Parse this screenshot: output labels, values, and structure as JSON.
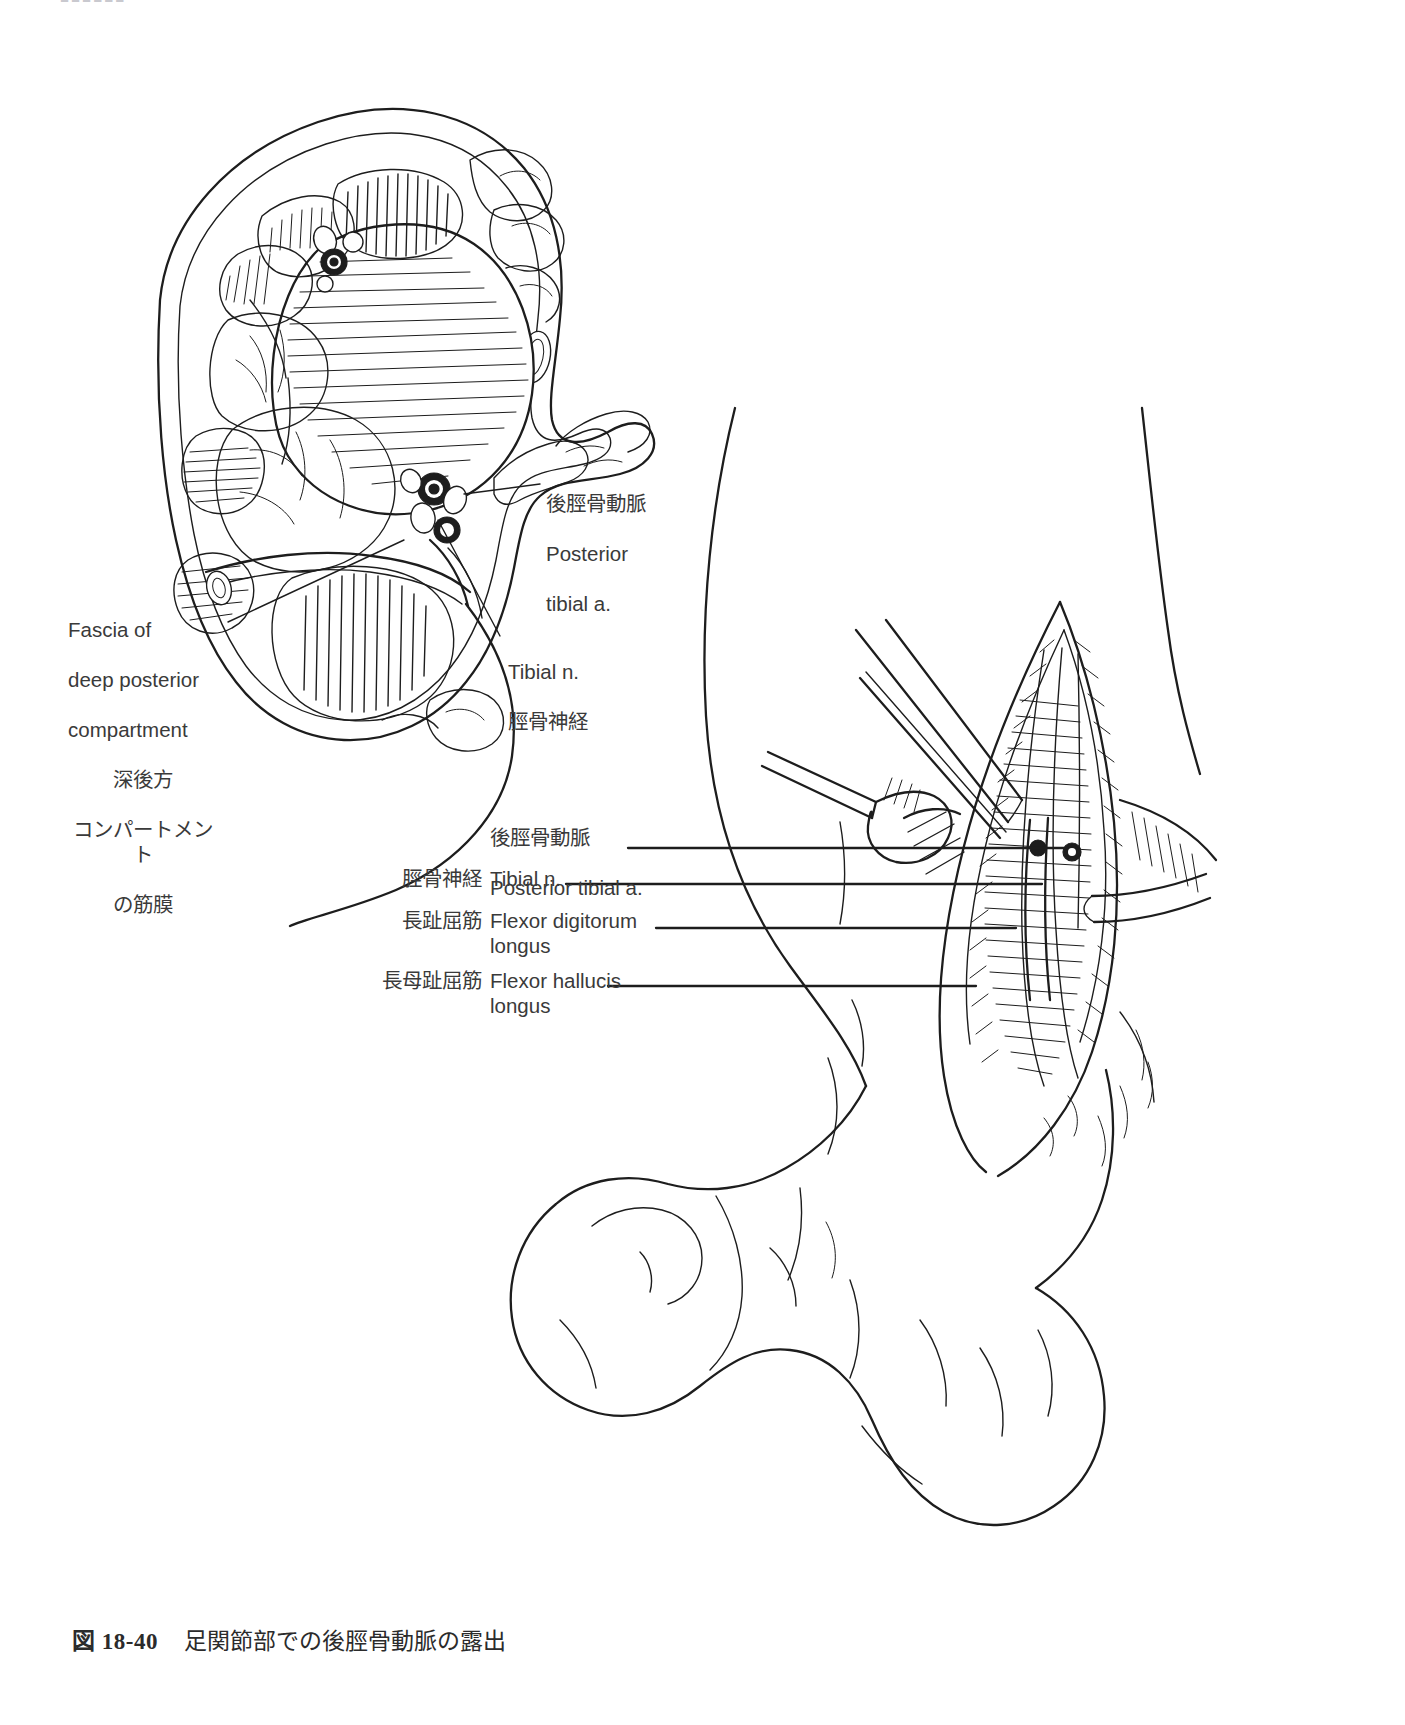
{
  "page": {
    "width": 1405,
    "height": 1725,
    "background": "#ffffff",
    "ink_color": "#1d1d1d",
    "text_color": "#3a3a3a",
    "running_head": "■■■■■■"
  },
  "caption": {
    "figure_number": "図 18-40",
    "text": "足関節部での後脛骨動脈の露出"
  },
  "inset_labels": {
    "posterior_tibial_artery": {
      "jp": "後脛骨動脈",
      "en_line1": "Posterior",
      "en_line2": "tibial a."
    },
    "fascia_deep_posterior_compartment": {
      "en_line1": "Fascia of",
      "en_line2": "deep posterior",
      "en_line3": "compartment",
      "jp_line1": "深後方",
      "jp_line2": "コンパートメント",
      "jp_line3": "の筋膜"
    },
    "tibial_nerve": {
      "en": "Tibial n.",
      "jp": "脛骨神経"
    }
  },
  "exposure_labels": [
    {
      "key": "posterior-tibial-artery",
      "jp": "後脛骨動脈",
      "en": "Posterior tibial a."
    },
    {
      "key": "tibial-nerve",
      "jp": "脛骨神経",
      "en": "Tibial n."
    },
    {
      "key": "flexor-digitorum-longus",
      "jp": "長趾屈筋",
      "en": "Flexor digitorum\nlongus"
    },
    {
      "key": "flexor-hallucis-longus",
      "jp": "長母趾屈筋",
      "en": "Flexor hallucis\nlongus"
    }
  ]
}
